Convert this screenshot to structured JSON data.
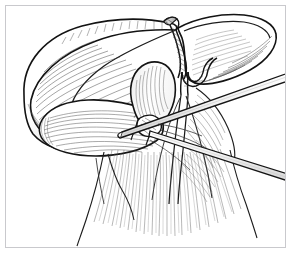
{
  "figure": {
    "domain": "medical-surgical-line-art",
    "title": "Hepatobiliary dissection line drawing",
    "caption": "",
    "style": "pen-and-ink hatched line art, monochrome",
    "background_color": "#ffffff",
    "ink_color": "#1a1a1a",
    "mid_tone_color": "#5c5c5c",
    "light_tone_color": "#9a9a9a",
    "frame": {
      "stroke_color": "#c9c9cd",
      "stroke_width": 1,
      "x": 5,
      "y": 5,
      "width": 281,
      "height": 243,
      "margin_color": "#ffffff"
    },
    "canvas": {
      "width": 293,
      "height": 263
    },
    "labels": [],
    "annotations": [],
    "legend": [],
    "parts": [
      {
        "id": "left-hepatic-lobe",
        "label": "Left hepatic lobe",
        "description": "Large crescent lobe occupying upper-left, retracted upward",
        "shading": "dense curved hatching along inferior margin"
      },
      {
        "id": "right-hepatic-lobe",
        "label": "Right hepatic lobe",
        "description": "Pointed wing-shaped lobe at upper right",
        "shading": "radiating hatch lines toward the tip"
      },
      {
        "id": "gallbladder",
        "label": "Gallbladder",
        "description": "Rounded sac at centre of field, elevated",
        "shading": "fine parallel hatching on left flank"
      },
      {
        "id": "quadrate-flap",
        "label": "Retracted tissue flap",
        "description": "Tongue-shaped flap directed left from the hilum",
        "shading": "long sweeping hatch strokes"
      },
      {
        "id": "cystic-duct-stump",
        "label": "Transected duct stump",
        "description": "Cut tubular stump at top centre with hatched cut face"
      },
      {
        "id": "duct-branch",
        "label": "Duct / vessel branch",
        "description": "Y-shaped bifurcation right of the gallbladder neck"
      },
      {
        "id": "hepatoduodenal-fibres",
        "label": "Ligamentous fibres",
        "description": "Broad fan of fine fibres descending from the hilum to the lower border"
      },
      {
        "id": "retractor-rod-upper",
        "label": "Surgical instrument rod (upper)",
        "description": "Straight slender rod entering from right edge, passing behind the hilum"
      },
      {
        "id": "retractor-rod-lower",
        "label": "Surgical instrument rod (lower)",
        "description": "Second parallel rod crossing lower right quadrant"
      }
    ]
  }
}
